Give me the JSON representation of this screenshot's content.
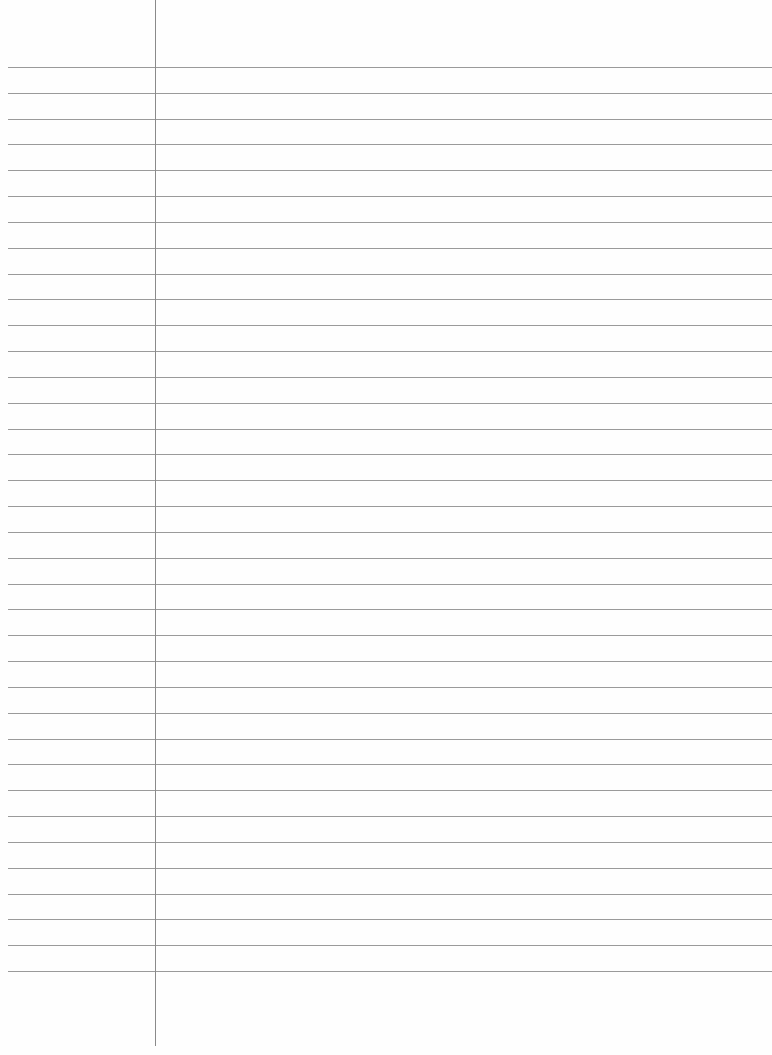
{
  "paper": {
    "type": "lined-notebook-page",
    "content_text": "",
    "background_color": "#ffffff",
    "rule_color": "#9a9a9a",
    "margin_line_color": "#8a8a8a",
    "rules": {
      "count": 36,
      "first_y": 67,
      "spacing": 25.83,
      "left_x": 8
    },
    "margin_line": {
      "x": 155,
      "top": 0,
      "bottom": 1046
    }
  }
}
